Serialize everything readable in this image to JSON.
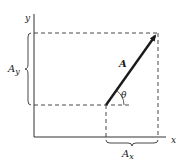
{
  "diagram": {
    "axes": {
      "x_label": "x",
      "y_label": "y"
    },
    "vector": {
      "label": "A",
      "angle_label": "θ"
    },
    "components": {
      "x": {
        "base": "A",
        "subscript": "x"
      },
      "y": {
        "base": "A",
        "subscript": "y"
      }
    },
    "colors": {
      "ink": "#1a1a1a",
      "background": "#ffffff"
    }
  }
}
